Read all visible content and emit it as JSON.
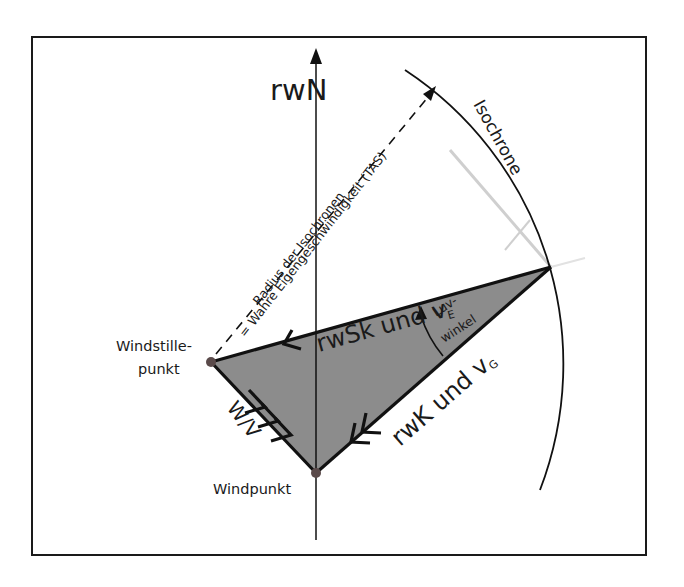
{
  "diagram": {
    "type": "wind-triangle",
    "labels": {
      "north_axis": "rwN",
      "isochrone": "Isochrone",
      "radius_line_1": "Radius der Isochronen",
      "radius_line_2": "= Wahre Eigengeschwindigkeit (TAS)",
      "heading_edge_main": "rwSk und v",
      "heading_edge_sub": "E",
      "track_edge_main": "rwK und v",
      "track_edge_sub": "G",
      "wind_edge": "W/V",
      "drift_angle_line1": "Luv-",
      "drift_angle_line2": "winkel",
      "calm_point_line1": "Windstille-",
      "calm_point_line2": "punkt",
      "wind_point": "Windpunkt"
    },
    "colors": {
      "frame": "#1a1a1a",
      "line": "#111111",
      "triangle_fill": "#8c8c8c",
      "vertex_dot": "#5a4a4a",
      "faint_line": "#c8c8c8"
    }
  }
}
